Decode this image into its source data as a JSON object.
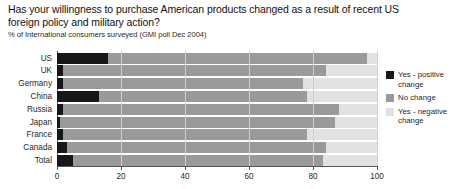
{
  "chart": {
    "title": "Has your willingness to purchase American products changed as a result of recent US foreign policy and military action?",
    "subtitle": "% of International consumers surveyed (GMI poll Dec 2004)"
  },
  "legend": {
    "items": [
      {
        "label": "Yes - positive\nchange",
        "color": "#171717",
        "key": "positive"
      },
      {
        "label": "No change",
        "color": "#9a9a9a",
        "key": "no-change"
      },
      {
        "label": "Yes - negative\nchange",
        "color": "#e2e2e2",
        "key": "negative"
      }
    ]
  },
  "axis": {
    "ticks": [
      {
        "value": 0,
        "label": "0"
      },
      {
        "value": 20,
        "label": "20"
      },
      {
        "value": 40,
        "label": "40"
      },
      {
        "value": 60,
        "label": "60"
      },
      {
        "value": 80,
        "label": "80"
      },
      {
        "value": 100,
        "label": "100"
      }
    ]
  },
  "chart_data": {
    "type": "bar",
    "orientation": "horizontal",
    "stacked": true,
    "title": "Has your willingness to purchase American products changed as a result of recent US foreign policy and military action?",
    "subtitle": "% of International consumers surveyed (GMI poll Dec 2004)",
    "xlabel": "",
    "ylabel": "",
    "xlim": [
      0,
      100
    ],
    "grid": true,
    "legend_position": "right",
    "categories": [
      "US",
      "UK",
      "Germany",
      "China",
      "Russia",
      "Japan",
      "France",
      "Canada",
      "Total"
    ],
    "series": [
      {
        "name": "Yes - positive change",
        "color": "#171717",
        "values": [
          16,
          2,
          2,
          13,
          2,
          1,
          2,
          3,
          5
        ]
      },
      {
        "name": "No change",
        "color": "#9a9a9a",
        "values": [
          81,
          82,
          75,
          65,
          86,
          86,
          76,
          81,
          78
        ]
      },
      {
        "name": "Yes - negative change",
        "color": "#e2e2e2",
        "values": [
          3,
          16,
          23,
          22,
          12,
          13,
          22,
          16,
          17
        ]
      }
    ]
  }
}
